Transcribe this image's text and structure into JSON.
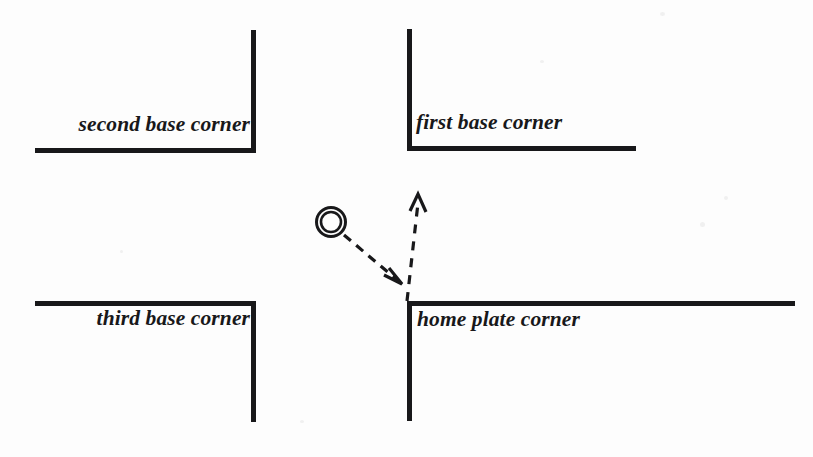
{
  "figure": {
    "background_color": "#fdfdfd",
    "ink_color": "#18181a",
    "width": 813,
    "height": 457
  },
  "labels": {
    "second_base": "second base corner",
    "first_base": "first base corner",
    "third_base": "third base corner",
    "home_plate": "home plate corner"
  },
  "diagram": {
    "corners": [
      {
        "name": "second base corner",
        "quadrant": "top-left",
        "vertical": {
          "x": 253,
          "y1": 30,
          "y2": 151
        },
        "horizontal": {
          "y": 150,
          "x1": 35,
          "x2": 255
        }
      },
      {
        "name": "first base corner",
        "quadrant": "top-right",
        "vertical": {
          "x": 409,
          "y1": 29,
          "y2": 149
        },
        "horizontal": {
          "y": 148,
          "x1": 407,
          "x2": 636
        }
      },
      {
        "name": "third base corner",
        "quadrant": "bottom-left",
        "horizontal": {
          "y": 303,
          "x1": 35,
          "x2": 256
        },
        "vertical": {
          "x": 254,
          "y1": 302,
          "y2": 422
        }
      },
      {
        "name": "home plate corner",
        "quadrant": "bottom-right",
        "horizontal": {
          "y": 303,
          "x1": 407,
          "x2": 795
        },
        "vertical": {
          "x": 409,
          "y1": 302,
          "y2": 421
        }
      }
    ],
    "ball_marker": {
      "name": "ball-marker",
      "center_x": 331,
      "center_y": 222,
      "outer_radius": 15,
      "inner_radius": 10.5,
      "stroke_width": 3
    },
    "arrows": [
      {
        "name": "incoming-throw-arrow",
        "style": "dashed",
        "from_x": 344,
        "from_y": 235,
        "to_x": 402,
        "to_y": 284,
        "description": "dashed arrow from ball marker toward home plate corner"
      },
      {
        "name": "outgoing-throw-arrow",
        "style": "dashed",
        "from_x": 407,
        "from_y": 300,
        "to_x": 418,
        "to_y": 195,
        "description": "dashed arrow from home plate corner pointing upward"
      }
    ],
    "line_weight": 5
  }
}
